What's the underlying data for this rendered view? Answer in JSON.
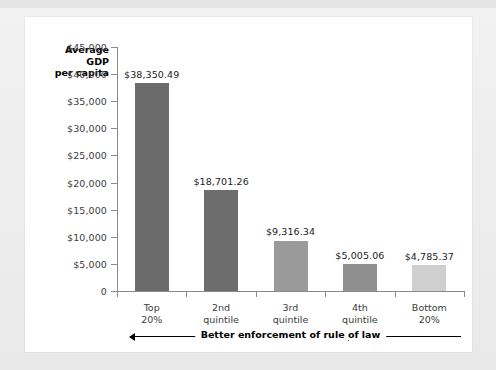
{
  "chart_data": {
    "type": "bar",
    "title": "",
    "xlabel": "",
    "ylabel": "Average GDP per capita",
    "ylabel_lines": [
      "Average",
      "GDP",
      "per capita"
    ],
    "categories": [
      "Top 20%",
      "2nd quintile",
      "3rd quintile",
      "4th quintile",
      "Bottom 20%"
    ],
    "category_lines": [
      [
        "Top",
        "20%"
      ],
      [
        "2nd",
        "quintile"
      ],
      [
        "3rd",
        "quintile"
      ],
      [
        "4th",
        "quintile"
      ],
      [
        "Bottom",
        "20%"
      ]
    ],
    "values": [
      38350.49,
      18701.26,
      9316.34,
      5005.06,
      4785.37
    ],
    "value_labels": [
      "$38,350.49",
      "$18,701.26",
      "$9,316.34",
      "$5,005.06",
      "$4,785.37"
    ],
    "bar_colors": [
      "#6b6b6b",
      "#6d6d6d",
      "#9a9a9a",
      "#8f8f8f",
      "#cfcfcf"
    ],
    "ylim": [
      0,
      45000
    ],
    "ytick_values": [
      0,
      5000,
      10000,
      15000,
      20000,
      25000,
      30000,
      35000,
      40000,
      45000
    ],
    "ytick_labels": [
      "0",
      "$5,000",
      "$10,000",
      "$15,000",
      "$20,000",
      "$25,000",
      "$30,000",
      "$35,000",
      "$40,000",
      "$45,000"
    ],
    "grid": false,
    "legend": false,
    "annotation": {
      "text": "Better enforcement of rule of law",
      "arrow_direction": "left",
      "position": "below-x-axis"
    }
  },
  "figure": {
    "panel_background": "#ffffff",
    "page_background": "#eeeeee",
    "axis_color": "#8a8a8a"
  }
}
